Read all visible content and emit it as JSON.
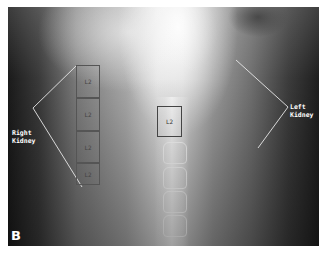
{
  "figure": {
    "panel_label": "B",
    "image_type": "abdominal x-ray",
    "annotations": {
      "right_label": "Right\nKidney",
      "left_label": "Left\nKidney",
      "right_boxes": [
        "L2",
        "L2",
        "L2",
        "L2"
      ],
      "spine_box": "L2"
    }
  }
}
